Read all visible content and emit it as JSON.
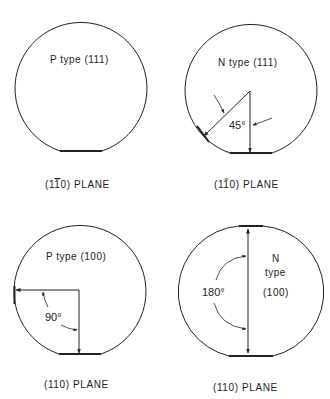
{
  "figure": {
    "wafers": [
      {
        "type_label": "P  type (111)",
        "caption_prefix": "(1",
        "caption_bar": "1",
        "caption_suffix": "0) PLANE",
        "angle": ""
      },
      {
        "type_label": "N  type (111)",
        "caption_prefix": "(1",
        "caption_bar": "1",
        "caption_suffix": "0) PLANE",
        "angle": "45°"
      },
      {
        "type_label": "P  type (100)",
        "caption": "(110) PLANE",
        "angle": "90°"
      },
      {
        "type_line1": "N",
        "type_line2": "type",
        "type_line3": "(100)",
        "caption": "(110) PLANE",
        "angle": "180°"
      }
    ]
  }
}
